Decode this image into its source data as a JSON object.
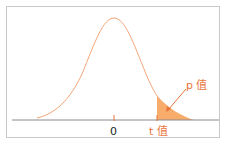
{
  "figure": {
    "type": "t-distribution p-value illustration",
    "labels": {
      "zero": "0",
      "t_value": "t 值",
      "p_value": "p 值"
    },
    "colors": {
      "curve": "#f4a679",
      "shaded_tail": "#f7a35c",
      "arrow": "#e8743b",
      "label_accent": "#e8743b",
      "axis": "#8a8a8a",
      "frame": "#c9c9c9"
    }
  }
}
